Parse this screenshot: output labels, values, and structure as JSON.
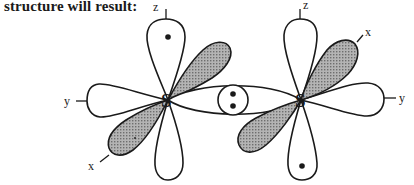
{
  "caption": "structure will result:",
  "atoms": [
    {
      "symbol": "S",
      "axes": {
        "z": "z",
        "y": "y",
        "x": "x"
      }
    },
    {
      "symbol": "S",
      "axes": {
        "z": "z",
        "y": "y",
        "x": "x"
      }
    }
  ],
  "bond": {
    "type": "sigma",
    "electrons": 2
  },
  "colors": {
    "line": "#1a1a1a",
    "shade": "#9a9a9a",
    "background": "#ffffff"
  }
}
